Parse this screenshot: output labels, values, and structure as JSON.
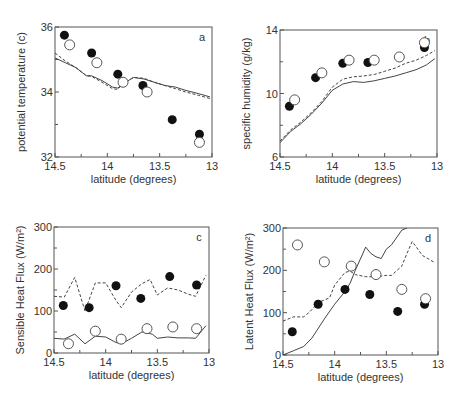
{
  "figure": {
    "width": 459,
    "height": 395
  },
  "colors": {
    "axis": "#555555",
    "text": "#333333",
    "line": "#444444",
    "filled": "#111111",
    "open_stroke": "#555555"
  },
  "chart_data": [
    {
      "panel": "a",
      "type": "line",
      "xlabel": "latitude (degrees)",
      "ylabel": "potential temperature (c)",
      "xlim": [
        14.5,
        13
      ],
      "ylim": [
        32,
        36
      ],
      "xticks": [
        14.5,
        14,
        13.5,
        13
      ],
      "xtick_labels": [
        "14.5",
        "14",
        "13.5",
        "13"
      ],
      "yticks": [
        32,
        34,
        36
      ],
      "ytick_labels": [
        "32",
        "34",
        "36"
      ],
      "minor_yticks": [
        33,
        35
      ],
      "minor_xticks": [
        14.25,
        13.75,
        13.25
      ],
      "box": [
        55,
        27,
        212,
        157
      ],
      "filled_points": {
        "x": [
          14.41,
          14.15,
          13.9,
          13.66,
          13.38,
          13.12
        ],
        "y": [
          35.75,
          35.2,
          34.55,
          34.2,
          33.15,
          32.7
        ]
      },
      "open_points": {
        "x": [
          14.36,
          14.1,
          13.85,
          13.62,
          13.12
        ],
        "y": [
          35.45,
          34.9,
          34.3,
          34.0,
          32.45
        ]
      },
      "series": [
        {
          "name": "solid",
          "style": "solid",
          "x": [
            14.5,
            14.4,
            14.3,
            14.2,
            14.15,
            14.05,
            13.95,
            13.9,
            13.85,
            13.75,
            13.65,
            13.55,
            13.45,
            13.35,
            13.25,
            13.13,
            13.02
          ],
          "y": [
            35.05,
            34.9,
            34.75,
            34.5,
            34.5,
            34.35,
            34.15,
            34.12,
            34.25,
            34.45,
            34.4,
            34.3,
            34.2,
            34.15,
            34.05,
            33.95,
            33.85
          ]
        },
        {
          "name": "dashed",
          "style": "dashed",
          "x": [
            14.5,
            14.4,
            14.3,
            14.2,
            14.15,
            14.05,
            13.95,
            13.9,
            13.85,
            13.75,
            13.65,
            13.55,
            13.45,
            13.35,
            13.25,
            13.13,
            13.02
          ],
          "y": [
            35.2,
            34.95,
            34.75,
            34.5,
            34.48,
            34.3,
            34.1,
            34.08,
            34.25,
            34.45,
            34.42,
            34.3,
            34.2,
            34.1,
            34.0,
            33.9,
            33.8
          ]
        }
      ],
      "annotation": "a",
      "legend": "none"
    },
    {
      "panel": "b",
      "type": "line",
      "xlabel": "latitude (degrees)",
      "ylabel": "specific humidity (g/kg)",
      "xlim": [
        14.5,
        13
      ],
      "ylim": [
        6,
        14
      ],
      "xticks": [
        14.5,
        14,
        13.5,
        13
      ],
      "xtick_labels": [
        "14.5",
        "14",
        "13.5",
        "13"
      ],
      "yticks": [
        6,
        10,
        14
      ],
      "ytick_labels": [
        "6",
        "10",
        "14"
      ],
      "minor_yticks": [
        8,
        12
      ],
      "minor_xticks": [
        14.25,
        13.75,
        13.25
      ],
      "box": [
        280,
        30,
        437,
        157
      ],
      "filled_points": {
        "x": [
          14.41,
          14.16,
          13.9,
          13.66,
          13.12
        ],
        "y": [
          9.2,
          11.0,
          11.9,
          11.95,
          12.9
        ]
      },
      "open_points": {
        "x": [
          14.36,
          14.1,
          13.84,
          13.6,
          13.36,
          13.12
        ],
        "y": [
          9.6,
          11.3,
          12.1,
          12.1,
          12.3,
          13.2
        ]
      },
      "series": [
        {
          "name": "solid",
          "style": "solid",
          "x": [
            14.5,
            14.4,
            14.3,
            14.2,
            14.1,
            14.0,
            13.9,
            13.8,
            13.7,
            13.6,
            13.5,
            13.4,
            13.3,
            13.2,
            13.1,
            13.02
          ],
          "y": [
            6.9,
            7.6,
            8.1,
            8.7,
            9.4,
            10.2,
            10.6,
            10.75,
            10.7,
            10.8,
            10.95,
            11.1,
            11.3,
            11.5,
            11.8,
            12.2
          ]
        },
        {
          "name": "dashed",
          "style": "dashed",
          "x": [
            14.5,
            14.4,
            14.3,
            14.2,
            14.1,
            14.0,
            13.9,
            13.8,
            13.7,
            13.6,
            13.5,
            13.4,
            13.3,
            13.2,
            13.1,
            13.02
          ],
          "y": [
            7.0,
            7.7,
            8.2,
            8.8,
            9.5,
            10.4,
            10.9,
            11.05,
            11.1,
            11.2,
            11.4,
            11.6,
            11.9,
            12.1,
            12.4,
            12.7
          ]
        }
      ],
      "annotation": "b",
      "legend": "none"
    },
    {
      "panel": "c",
      "type": "line",
      "xlabel": "latitude (degrees)",
      "ylabel": "Sensible Heat Flux (W/m²)",
      "xlim": [
        14.5,
        13
      ],
      "ylim": [
        0,
        300
      ],
      "xticks": [
        14.5,
        14,
        13.5,
        13
      ],
      "xtick_labels": [
        "14.5",
        "14",
        "13.5",
        "13"
      ],
      "yticks": [
        0,
        100,
        200,
        300
      ],
      "ytick_labels": [
        "0",
        "100",
        "200",
        "300"
      ],
      "minor_yticks": [
        50,
        150,
        250
      ],
      "minor_xticks": [
        14.25,
        13.75,
        13.25
      ],
      "box": [
        54,
        227,
        209,
        353
      ],
      "filled_points": {
        "x": [
          14.41,
          14.16,
          13.9,
          13.66,
          13.38,
          13.12
        ],
        "y": [
          113,
          108,
          160,
          130,
          182,
          162
        ]
      },
      "open_points": {
        "x": [
          14.36,
          14.1,
          13.85,
          13.6,
          13.35,
          13.12
        ],
        "y": [
          22,
          52,
          33,
          58,
          62,
          58
        ]
      },
      "series": [
        {
          "name": "solid",
          "style": "solid",
          "x": [
            14.5,
            14.4,
            14.3,
            14.2,
            14.1,
            14.0,
            13.9,
            13.85,
            13.75,
            13.65,
            13.55,
            13.5,
            13.4,
            13.3,
            13.2,
            13.13,
            13.03
          ],
          "y": [
            35,
            33,
            45,
            22,
            40,
            38,
            25,
            22,
            35,
            50,
            45,
            35,
            38,
            36,
            36,
            35,
            65
          ]
        },
        {
          "name": "dashed",
          "style": "dashed",
          "x": [
            14.5,
            14.4,
            14.3,
            14.2,
            14.1,
            14.0,
            13.9,
            13.85,
            13.75,
            13.65,
            13.57,
            13.5,
            13.4,
            13.3,
            13.2,
            13.13,
            13.03
          ],
          "y": [
            135,
            133,
            180,
            100,
            167,
            167,
            125,
            108,
            145,
            165,
            175,
            138,
            155,
            150,
            140,
            135,
            185
          ]
        }
      ],
      "annotation": "c",
      "legend": "none"
    },
    {
      "panel": "d",
      "type": "line",
      "xlabel": "latitude (degrees)",
      "ylabel": "Latent Heat Flux (W/m²)",
      "xlim": [
        14.5,
        13
      ],
      "ylim": [
        0,
        300
      ],
      "xticks": [
        14.5,
        14,
        13.5,
        13
      ],
      "xtick_labels": [
        "14.5",
        "14",
        "13.5",
        "13"
      ],
      "yticks": [
        0,
        100,
        200,
        300
      ],
      "ytick_labels": [
        "0",
        "100",
        "200",
        "300"
      ],
      "minor_yticks": [
        50,
        150,
        250
      ],
      "minor_xticks": [
        14.25,
        13.75,
        13.25
      ],
      "box": [
        283,
        228,
        438,
        355
      ],
      "filled_points": {
        "x": [
          14.41,
          14.16,
          13.9,
          13.66,
          13.39,
          13.13
        ],
        "y": [
          55,
          120,
          155,
          143,
          103,
          120
        ]
      },
      "open_points": {
        "x": [
          14.36,
          14.1,
          13.84,
          13.6,
          13.35,
          13.12
        ],
        "y": [
          260,
          220,
          210,
          190,
          155,
          133
        ]
      },
      "series": [
        {
          "name": "solid",
          "style": "solid",
          "x": [
            14.5,
            14.4,
            14.3,
            14.22,
            14.1,
            14.0,
            13.9,
            13.85,
            13.8,
            13.7,
            13.65,
            13.6,
            13.55,
            13.5,
            13.45,
            13.35,
            13.3
          ],
          "y": [
            0,
            10,
            20,
            40,
            85,
            120,
            150,
            170,
            200,
            255,
            240,
            232,
            228,
            250,
            260,
            295,
            300
          ]
        },
        {
          "name": "dashed",
          "style": "dashed",
          "x": [
            14.5,
            14.4,
            14.3,
            14.25,
            14.15,
            14.05,
            14.0,
            13.9,
            13.85,
            13.8,
            13.7,
            13.6,
            13.5,
            13.45,
            13.35,
            13.3,
            13.25,
            13.15,
            13.03
          ],
          "y": [
            80,
            90,
            90,
            100,
            125,
            135,
            165,
            195,
            198,
            190,
            185,
            185,
            188,
            188,
            210,
            240,
            268,
            235,
            218
          ]
        }
      ],
      "annotation": "d",
      "legend": "none"
    }
  ]
}
